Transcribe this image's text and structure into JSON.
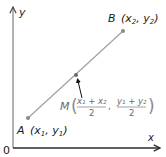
{
  "diagram": {
    "axes": {
      "x_label": "x",
      "y_label": "y",
      "origin_label": "0",
      "axis_color": "#2a2a2a",
      "y_axis_color": "#8a8a8a"
    },
    "points": {
      "A": {
        "name": "A",
        "coords": "(x₁, y₁)",
        "sub_x": "1",
        "sub_y": "1",
        "px": [
          28,
          118
        ]
      },
      "B": {
        "name": "B",
        "coords": "(x₂, y₂)",
        "sub_x": "2",
        "sub_y": "2",
        "px": [
          123,
          31
        ]
      },
      "M": {
        "name": "M",
        "x_numerator": "x₁ + x₂",
        "y_numerator": "y₁ + y₂",
        "denominator": "2",
        "px": [
          76,
          75
        ]
      }
    },
    "segment_color": "#a0a0a0",
    "point_color": "#8a8a8a",
    "arrow_color": "#111111"
  }
}
